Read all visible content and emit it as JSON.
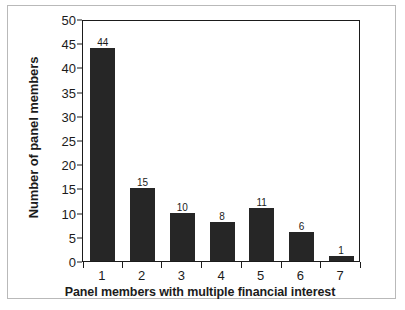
{
  "chart_data": {
    "type": "bar",
    "title": "",
    "xlabel": "Panel members with multiple financial interest",
    "ylabel": "Number of panel members",
    "categories": [
      "1",
      "2",
      "3",
      "4",
      "5",
      "6",
      "7"
    ],
    "values": [
      44,
      15,
      10,
      8,
      11,
      6,
      1
    ],
    "data_labels": [
      "44",
      "15",
      "10",
      "8",
      "11",
      "6",
      "1"
    ],
    "ylim": [
      0,
      50
    ],
    "ytick_values": [
      0,
      5,
      10,
      15,
      20,
      25,
      30,
      35,
      40,
      45,
      50
    ],
    "ytick_labels": [
      "0",
      "5",
      "10",
      "15",
      "20",
      "25",
      "30",
      "35",
      "40",
      "45",
      "50"
    ],
    "grid": false,
    "legend": false,
    "bar_color": "#262626",
    "axis_color": "#1b1b1b",
    "frame_color": "#b9b9b9",
    "background_color": "#ffffff"
  }
}
